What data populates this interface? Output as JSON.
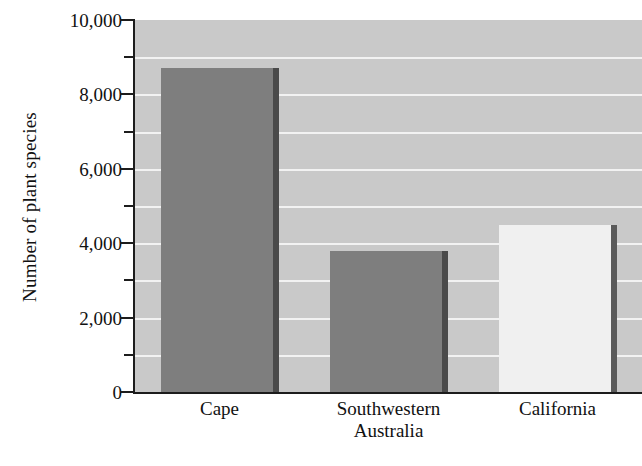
{
  "chart_data": {
    "type": "bar",
    "title": "",
    "subtitle": "",
    "xlabel": "",
    "ylabel": "Number of plant species",
    "categories": [
      "Cape",
      "Southwestern Australia",
      "California"
    ],
    "category_lines": [
      [
        "Cape"
      ],
      [
        "Southwestern",
        "Australia"
      ],
      [
        "California"
      ]
    ],
    "values": [
      8700,
      3800,
      4500
    ],
    "ylim": [
      0,
      10000
    ],
    "ytick_values": [
      0,
      2000,
      4000,
      6000,
      8000,
      10000
    ],
    "ytick_labels": [
      "0",
      "2,000",
      "4,000",
      "6,000",
      "8,000",
      "10,000"
    ],
    "yminor_tick_values": [
      1000,
      3000,
      5000,
      7000,
      9000
    ],
    "gridline_values": [
      1000,
      2000,
      3000,
      4000,
      5000,
      6000,
      7000,
      8000,
      9000
    ],
    "grid": true,
    "grid_orientation": "horizontal",
    "legend": null,
    "legend_position": "none",
    "bar_colors": [
      "#7e7e7e",
      "#7e7e7e",
      "#f0f0f0"
    ],
    "bar_shadow_colors": [
      "#4a4a4a",
      "#4a4a4a",
      "#5a5a5a"
    ],
    "plot_background": "#c9c9c9",
    "gridline_color": "#f2f2f2",
    "axis_color": "#1c1c1c",
    "text_color": "#111111",
    "figure_background": "#ffffff"
  }
}
